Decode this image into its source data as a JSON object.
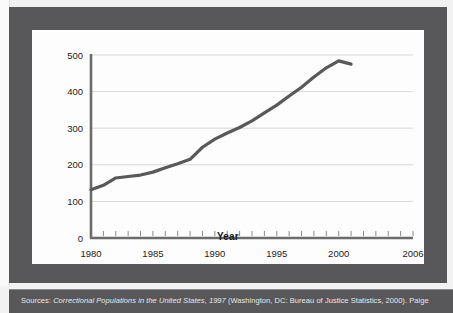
{
  "chart_data": {
    "type": "line",
    "title": "",
    "xlabel": "Year",
    "ylabel": "",
    "xlim": [
      1980,
      2006
    ],
    "ylim": [
      0,
      500
    ],
    "grid": true,
    "legend": false,
    "x_ticks": [
      1980,
      1985,
      1990,
      1995,
      2000,
      2006
    ],
    "x_tick_labels": [
      "1980",
      "1985",
      "1990",
      "1995",
      "2000",
      "2006"
    ],
    "y_ticks": [
      0,
      100,
      200,
      300,
      400,
      500
    ],
    "y_tick_labels": [
      "0",
      "100",
      "200",
      "300",
      "400",
      "500"
    ],
    "x_minor_tick_interval": 1,
    "line_color": "#595959",
    "x": [
      1980,
      1981,
      1982,
      1983,
      1984,
      1985,
      1986,
      1987,
      1988,
      1989,
      1990,
      1991,
      1992,
      1993,
      1994,
      1995,
      1996,
      1997,
      1998,
      1999,
      2000,
      2001
    ],
    "values": [
      132,
      144,
      164,
      168,
      172,
      180,
      192,
      203,
      215,
      248,
      270,
      287,
      302,
      320,
      342,
      363,
      388,
      412,
      440,
      465,
      484,
      475
    ],
    "series": [
      {
        "name": "Correctional population",
        "values": [
          132,
          144,
          164,
          168,
          172,
          180,
          192,
          203,
          215,
          248,
          270,
          287,
          302,
          320,
          342,
          363,
          388,
          412,
          440,
          465,
          484,
          475
        ]
      }
    ]
  },
  "caption": {
    "prefix": "Sources: ",
    "italic_title": "Correctional Populations in the United States, 1997",
    "suffix": " (Washington, DC: Bureau of Justice Statistics, 2000). Paige"
  },
  "colors": {
    "frame": "#58585a",
    "panel": "#fdfdfd",
    "line": "#595959",
    "gridline": "#d8d8d8",
    "axis": "#6b6b6d"
  }
}
